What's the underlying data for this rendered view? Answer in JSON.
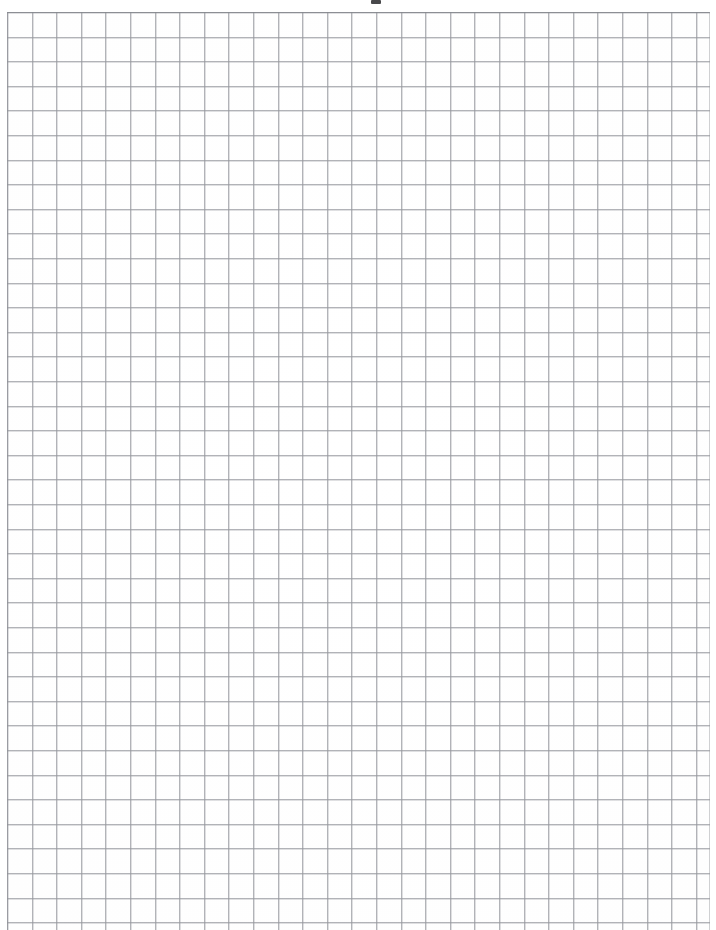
{
  "document": {
    "kind": "scanned-graph-paper",
    "title": "Blank Quadrille / Graph Paper Scan",
    "description": "A scanned blank sheet of square-ruled graph paper with no handwriting, labels or printed text.",
    "page_width_px": 716,
    "page_height_px": 930,
    "background_color": "#ffffff",
    "paper_tint": "#fefefe"
  },
  "grid": {
    "style": "square-quadrille",
    "cell_size_px": 24.6,
    "line_color": "#96989e",
    "line_width_px": 1,
    "columns_visible": 28,
    "rows_visible": 37,
    "origin_x_px": 7,
    "origin_y_px": 12,
    "right_edge_px": 710,
    "bottom_edge_px": 930,
    "bottom_cropped": true,
    "border_color": "#82848a"
  },
  "margins": {
    "left_px": 7,
    "top_px": 12,
    "right_px": 6,
    "bottom_px": 0,
    "margin_color": "#ffffff"
  },
  "artifacts": [
    {
      "name": "top-center-smudge",
      "type": "scan-smudge",
      "x_px": 371,
      "y_px": 0,
      "width_px": 10,
      "height_px": 4,
      "color": "#3a3a3c"
    }
  ],
  "content": {
    "text_present": false,
    "handwriting_present": false,
    "drawings_present": false,
    "notes": "Sheet is entirely blank apart from the printed ruling and a small scanning artifact."
  }
}
